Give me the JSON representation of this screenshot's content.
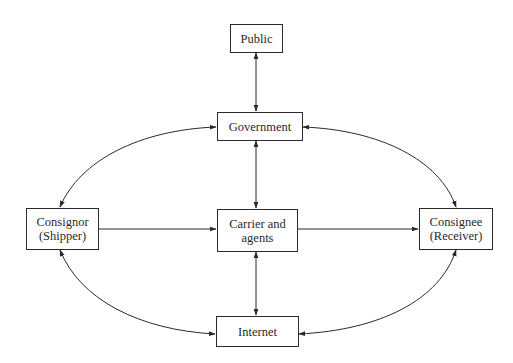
{
  "diagram": {
    "type": "flow",
    "nodes": [
      {
        "id": "public",
        "lines": [
          "Public"
        ]
      },
      {
        "id": "government",
        "lines": [
          "Government"
        ]
      },
      {
        "id": "consignor",
        "lines": [
          "Consignor",
          "(Shipper)"
        ]
      },
      {
        "id": "carrier",
        "lines": [
          "Carrier and",
          "agents"
        ]
      },
      {
        "id": "consignee",
        "lines": [
          "Consignee",
          "(Receiver)"
        ]
      },
      {
        "id": "internet",
        "lines": [
          "Internet"
        ]
      }
    ],
    "edges": [
      {
        "from": "public",
        "to": "government",
        "direction": "bidirectional",
        "shape": "straight"
      },
      {
        "from": "government",
        "to": "carrier",
        "direction": "bidirectional",
        "shape": "straight"
      },
      {
        "from": "internet",
        "to": "carrier",
        "direction": "bidirectional",
        "shape": "straight"
      },
      {
        "from": "consignor",
        "to": "carrier",
        "direction": "forward",
        "shape": "straight"
      },
      {
        "from": "carrier",
        "to": "consignee",
        "direction": "forward",
        "shape": "straight"
      },
      {
        "from": "government",
        "to": "consignor",
        "direction": "bidirectional",
        "shape": "curve"
      },
      {
        "from": "government",
        "to": "consignee",
        "direction": "bidirectional",
        "shape": "curve"
      },
      {
        "from": "consignor",
        "to": "internet",
        "direction": "bidirectional",
        "shape": "curve"
      },
      {
        "from": "consignee",
        "to": "internet",
        "direction": "bidirectional",
        "shape": "curve"
      }
    ]
  },
  "colors": {
    "line": "#2a2a2a",
    "background": "#ffffff"
  }
}
